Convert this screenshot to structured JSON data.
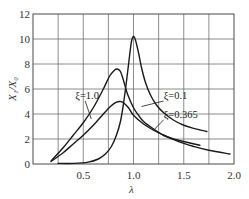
{
  "chart_data": {
    "type": "line",
    "title": "",
    "xlabel": "λ",
    "ylabel": "X₁/X₀",
    "xlim": [
      0,
      2.0
    ],
    "ylim": [
      0,
      12
    ],
    "grid": true,
    "x_ticks": [
      0.5,
      1.0,
      1.5,
      2.0
    ],
    "x_tick_labels": [
      "0.5",
      "1.0",
      "1.5",
      "2.0"
    ],
    "x_grid_step": 0.25,
    "y_ticks": [
      0,
      2,
      4,
      6,
      8,
      10,
      12
    ],
    "y_tick_labels": [
      "0",
      "2",
      "4",
      "6",
      "8",
      "10",
      "12"
    ],
    "series": [
      {
        "name": "ξ=0.1",
        "label": "ξ=0.1",
        "x": [
          0.25,
          0.4,
          0.55,
          0.65,
          0.72,
          0.78,
          0.83,
          0.87,
          0.9,
          0.93,
          0.96,
          0.98,
          1.0,
          1.02,
          1.05,
          1.08,
          1.12,
          1.17,
          1.23,
          1.3,
          1.4,
          1.5,
          1.6,
          1.73
        ],
        "y": [
          0.05,
          0.05,
          0.15,
          0.4,
          0.8,
          1.4,
          2.3,
          3.4,
          4.8,
          6.6,
          8.6,
          9.8,
          10.2,
          9.9,
          8.9,
          7.7,
          6.5,
          5.5,
          4.7,
          4.1,
          3.5,
          3.1,
          2.85,
          2.6
        ],
        "annotation": {
          "text": "ξ=0.1",
          "at": [
            1.3,
            5.2
          ],
          "points_to": [
            1.08,
            4.6
          ]
        }
      },
      {
        "name": "ξ=0.365",
        "label": "ξ=0.365",
        "x": [
          0.18,
          0.3,
          0.4,
          0.5,
          0.6,
          0.7,
          0.76,
          0.81,
          0.84,
          0.87,
          0.9,
          0.94,
          1.0,
          1.05,
          1.1,
          1.2,
          1.3,
          1.4,
          1.5,
          1.66
        ],
        "y": [
          0.25,
          1.3,
          2.3,
          3.3,
          4.5,
          6.0,
          7.0,
          7.5,
          7.6,
          7.4,
          6.7,
          5.6,
          4.5,
          3.9,
          3.4,
          2.8,
          2.3,
          2.0,
          1.8,
          1.5
        ],
        "annotation": {
          "text": "ξ=0.365",
          "at": [
            1.3,
            3.7
          ],
          "points_to": [
            1.2,
            2.7
          ]
        }
      },
      {
        "name": "ξ=1.0",
        "label": "ξ=1.0",
        "x": [
          0.18,
          0.3,
          0.4,
          0.5,
          0.6,
          0.7,
          0.77,
          0.83,
          0.87,
          0.9,
          0.95,
          1.0,
          1.1,
          1.2,
          1.3,
          1.4,
          1.5,
          1.6,
          1.75,
          1.96
        ],
        "y": [
          0.2,
          0.9,
          1.6,
          2.3,
          3.1,
          4.0,
          4.6,
          4.95,
          5.0,
          4.9,
          4.5,
          3.9,
          3.2,
          2.7,
          2.3,
          1.95,
          1.65,
          1.4,
          1.1,
          0.8
        ],
        "annotation": {
          "text": "ξ=1.0",
          "at": [
            0.42,
            5.2
          ],
          "points_to": [
            0.58,
            3.6
          ]
        }
      }
    ]
  }
}
